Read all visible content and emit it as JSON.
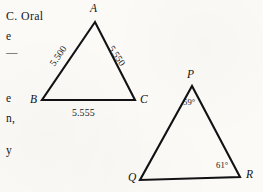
{
  "page": {
    "background_color": "#fbfaf7",
    "ink_color": "#121214",
    "width": 263,
    "height": 192
  },
  "margin_text": {
    "lines": [
      {
        "text": "C.  Oral",
        "x": 6,
        "y": 11
      },
      {
        "text": "e",
        "x": 6,
        "y": 31
      },
      {
        "text": "—",
        "x": 6,
        "y": 47
      },
      {
        "text": "e",
        "x": 6,
        "y": 93
      },
      {
        "text": "n,",
        "x": 6,
        "y": 113
      },
      {
        "text": "y",
        "x": 6,
        "y": 145
      }
    ]
  },
  "figures": [
    {
      "id": "triangle-abc",
      "name": "Triangle ABC",
      "vertices": [
        {
          "label": "A",
          "x": 95,
          "y": 22,
          "label_x": 90,
          "label_y": 3
        },
        {
          "label": "B",
          "x": 42,
          "y": 100,
          "label_x": 30,
          "label_y": 94
        },
        {
          "label": "C",
          "x": 135,
          "y": 100,
          "label_x": 140,
          "label_y": 94
        }
      ],
      "sides": [
        {
          "between": "AB",
          "value": "5.500",
          "x": 47,
          "y": 51,
          "orientation": "rot-left"
        },
        {
          "between": "AC",
          "value": "5.550",
          "x": 106,
          "y": 51,
          "orientation": "rot-right"
        },
        {
          "between": "BC",
          "value": "5.555",
          "x": 72,
          "y": 108,
          "orientation": "flat"
        }
      ],
      "angles": []
    },
    {
      "id": "triangle-pqr",
      "name": "Triangle PQR",
      "vertices": [
        {
          "label": "P",
          "x": 192,
          "y": 86,
          "label_x": 187,
          "label_y": 69
        },
        {
          "label": "Q",
          "x": 140,
          "y": 180,
          "label_x": 128,
          "label_y": 172
        },
        {
          "label": "R",
          "x": 240,
          "y": 177,
          "label_x": 246,
          "label_y": 169
        }
      ],
      "sides": [],
      "angles": [
        {
          "at": "P",
          "value": "59°",
          "x": 183,
          "y": 98
        },
        {
          "at": "R",
          "value": "61°",
          "x": 216,
          "y": 161
        }
      ]
    }
  ]
}
